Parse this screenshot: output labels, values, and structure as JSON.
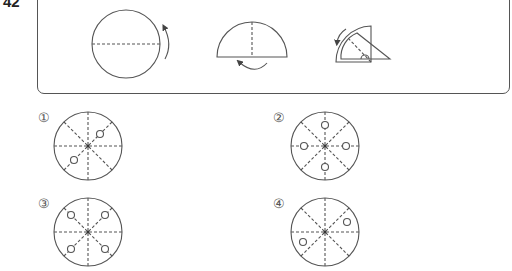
{
  "question": {
    "number": "42"
  },
  "folding_steps": [
    {
      "shape": "full-circle",
      "fold_line": "horizontal-diameter",
      "arrow": "fold-up-right"
    },
    {
      "shape": "semicircle",
      "fold_line": "vertical-radius",
      "arrow": "fold-under-bottom"
    },
    {
      "shape": "quarter-circle",
      "fold_line": "diagonal-bisector",
      "arrow": "fold-along-arc"
    },
    {
      "shape": "eighth-sector",
      "hole": "semicircle-notch-on-base"
    }
  ],
  "options": [
    {
      "label": "①",
      "holes": "two holes on diagonal (upper-right, lower-left)"
    },
    {
      "label": "②",
      "holes": "three holes (top, left, right, bottom variant)"
    },
    {
      "label": "③",
      "holes": "four holes on diagonals"
    },
    {
      "label": "④",
      "holes": "two holes (right-upper, left-lower)"
    }
  ],
  "colors": {
    "line": "#555555",
    "background": "#ffffff"
  }
}
